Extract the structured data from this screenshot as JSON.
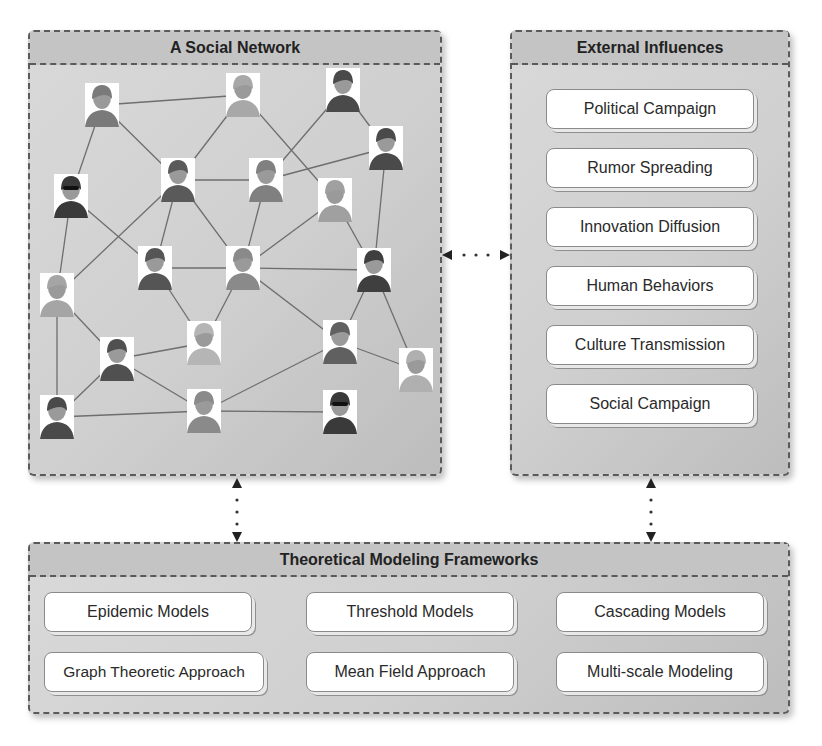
{
  "network_panel": {
    "title": "A Social Network",
    "nodes": [
      {
        "id": "n1",
        "x": 102,
        "y": 105,
        "kind": "man-mustache",
        "tone": "#7a7a7a"
      },
      {
        "id": "n2",
        "x": 243,
        "y": 95,
        "kind": "old-man-tie",
        "tone": "#a8a8a8"
      },
      {
        "id": "n3",
        "x": 343,
        "y": 90,
        "kind": "dark-person",
        "tone": "#4a4a4a"
      },
      {
        "id": "n4",
        "x": 71,
        "y": 196,
        "kind": "sunglasses",
        "tone": "#3a3a3a"
      },
      {
        "id": "n5",
        "x": 178,
        "y": 180,
        "kind": "woman-bob",
        "tone": "#5a5a5a"
      },
      {
        "id": "n6",
        "x": 386,
        "y": 148,
        "kind": "woman-dark-bob",
        "tone": "#4a4a4a"
      },
      {
        "id": "n7",
        "x": 266,
        "y": 180,
        "kind": "woman",
        "tone": "#808080"
      },
      {
        "id": "n8",
        "x": 335,
        "y": 200,
        "kind": "old-man",
        "tone": "#a0a0a0"
      },
      {
        "id": "n9",
        "x": 155,
        "y": 268,
        "kind": "long-hair-woman",
        "tone": "#555555"
      },
      {
        "id": "n10",
        "x": 243,
        "y": 268,
        "kind": "man-hat",
        "tone": "#8a8a8a"
      },
      {
        "id": "n11",
        "x": 374,
        "y": 270,
        "kind": "dark-man",
        "tone": "#3f3f3f"
      },
      {
        "id": "n12",
        "x": 57,
        "y": 295,
        "kind": "old-man",
        "tone": "#a5a5a5"
      },
      {
        "id": "n13",
        "x": 204,
        "y": 343,
        "kind": "blonde-woman",
        "tone": "#b5b5b5"
      },
      {
        "id": "n14",
        "x": 117,
        "y": 359,
        "kind": "boy",
        "tone": "#505050"
      },
      {
        "id": "n15",
        "x": 340,
        "y": 342,
        "kind": "man",
        "tone": "#606060"
      },
      {
        "id": "n16",
        "x": 416,
        "y": 370,
        "kind": "old-man",
        "tone": "#b0b0b0"
      },
      {
        "id": "n17",
        "x": 57,
        "y": 417,
        "kind": "boy",
        "tone": "#4a4a4a"
      },
      {
        "id": "n18",
        "x": 204,
        "y": 411,
        "kind": "woman",
        "tone": "#8a8a8a"
      },
      {
        "id": "n19",
        "x": 340,
        "y": 412,
        "kind": "sunglasses",
        "tone": "#3a3a3a"
      }
    ],
    "edges": [
      [
        "n1",
        "n2"
      ],
      [
        "n1",
        "n4"
      ],
      [
        "n1",
        "n5"
      ],
      [
        "n2",
        "n5"
      ],
      [
        "n2",
        "n8"
      ],
      [
        "n3",
        "n7"
      ],
      [
        "n3",
        "n6"
      ],
      [
        "n6",
        "n7"
      ],
      [
        "n6",
        "n11"
      ],
      [
        "n5",
        "n7"
      ],
      [
        "n5",
        "n9"
      ],
      [
        "n5",
        "n12"
      ],
      [
        "n5",
        "n10"
      ],
      [
        "n4",
        "n9"
      ],
      [
        "n4",
        "n12"
      ],
      [
        "n7",
        "n10"
      ],
      [
        "n8",
        "n10"
      ],
      [
        "n8",
        "n11"
      ],
      [
        "n9",
        "n10"
      ],
      [
        "n10",
        "n11"
      ],
      [
        "n9",
        "n13"
      ],
      [
        "n10",
        "n13"
      ],
      [
        "n10",
        "n15"
      ],
      [
        "n11",
        "n15"
      ],
      [
        "n11",
        "n16"
      ],
      [
        "n12",
        "n14"
      ],
      [
        "n12",
        "n17"
      ],
      [
        "n14",
        "n13"
      ],
      [
        "n14",
        "n18"
      ],
      [
        "n17",
        "n14"
      ],
      [
        "n17",
        "n18"
      ],
      [
        "n18",
        "n15"
      ],
      [
        "n18",
        "n19"
      ],
      [
        "n15",
        "n16"
      ]
    ]
  },
  "external_panel": {
    "title": "External Influences",
    "items": [
      "Political Campaign",
      "Rumor Spreading",
      "Innovation Diffusion",
      "Human Behaviors",
      "Culture Transmission",
      "Social Campaign"
    ]
  },
  "frameworks_panel": {
    "title": "Theoretical Modeling Frameworks",
    "items": [
      "Epidemic Models",
      "Threshold Models",
      "Cascading Models",
      "Graph Theoretic Approach",
      "Mean Field Approach",
      "Multi-scale Modeling"
    ]
  },
  "connectors": [
    {
      "name": "network-external-connector",
      "type": "bidirectional-dotted",
      "orientation": "horizontal"
    },
    {
      "name": "network-frameworks-connector",
      "type": "bidirectional-dotted",
      "orientation": "vertical"
    },
    {
      "name": "external-frameworks-connector",
      "type": "bidirectional-dotted",
      "orientation": "vertical"
    }
  ],
  "colors": {
    "border": "#5a5a5a",
    "panel_bg": "#d2d2d2",
    "header_bg": "#c4c4c4",
    "edge": "#6e6e6e",
    "box_bg": "#ffffff"
  }
}
